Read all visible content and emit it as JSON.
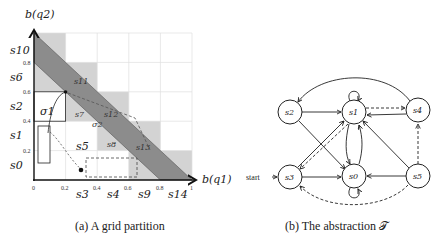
{
  "figure_a": {
    "caption": "(a) A grid partition",
    "y_axis_label": "b(q2)",
    "x_axis_label": "b(q1)",
    "x_ticks": [
      "0",
      "0.2",
      "0.4",
      "0.6",
      "0.8",
      "1"
    ],
    "y_ticks": [
      "0.2",
      "0.4",
      "0.6",
      "0.8",
      "1"
    ],
    "row_labels": [
      "s0",
      "s1",
      "s2",
      "s6",
      "s10"
    ],
    "col_labels": [
      "s3",
      "s4",
      "s9",
      "s14"
    ],
    "cell_labels": [
      "s5",
      "s7",
      "s8",
      "s11",
      "s12",
      "s13"
    ],
    "trajectory_labels": [
      "σ1",
      "σ2"
    ],
    "colors": {
      "light_cell": "#d3d3d3",
      "band": "#8c8c8c",
      "grid": "#e0e0e0"
    }
  },
  "figure_b": {
    "caption": "(b) The abstraction 𝒯",
    "start_label": "start",
    "nodes": [
      {
        "id": "s0",
        "label": "s0"
      },
      {
        "id": "s1",
        "label": "s1"
      },
      {
        "id": "s2",
        "label": "s2"
      },
      {
        "id": "s3",
        "label": "s3"
      },
      {
        "id": "s4",
        "label": "s4"
      },
      {
        "id": "s5",
        "label": "s5"
      }
    ],
    "edges": [
      {
        "from": "s2",
        "to": "s1",
        "style": "solid"
      },
      {
        "from": "s2",
        "to": "s0",
        "style": "solid"
      },
      {
        "from": "s3",
        "to": "s1",
        "style": "solid"
      },
      {
        "from": "s3",
        "to": "s0",
        "style": "solid"
      },
      {
        "from": "s1",
        "to": "s3",
        "style": "dashed"
      },
      {
        "from": "s1",
        "to": "s0",
        "style": "solid"
      },
      {
        "from": "s0",
        "to": "s1",
        "style": "solid"
      },
      {
        "from": "s1",
        "to": "s1",
        "style": "solid"
      },
      {
        "from": "s0",
        "to": "s0",
        "style": "solid"
      },
      {
        "from": "s1",
        "to": "s4",
        "style": "dashed"
      },
      {
        "from": "s4",
        "to": "s1",
        "style": "solid"
      },
      {
        "from": "s4",
        "to": "s2",
        "style": "solid"
      },
      {
        "from": "s5",
        "to": "s1",
        "style": "solid"
      },
      {
        "from": "s5",
        "to": "s0",
        "style": "solid"
      },
      {
        "from": "s5",
        "to": "s4",
        "style": "dashed"
      },
      {
        "from": "s5",
        "to": "s3",
        "style": "dashed"
      }
    ]
  }
}
